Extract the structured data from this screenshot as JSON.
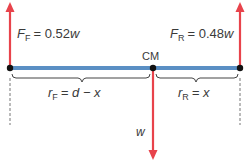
{
  "diagram": {
    "colors": {
      "force": "#e8434b",
      "beam": "#5a8fc4",
      "point": "#111111",
      "brace": "#444444",
      "dashed": "#777777",
      "text": "#3a3a3a"
    },
    "forces": {
      "front": {
        "symbol": "F",
        "subscript": "F",
        "rhs": "= 0.52",
        "var": "w"
      },
      "rear": {
        "symbol": "F",
        "subscript": "R",
        "rhs": "= 0.48",
        "var": "w"
      },
      "weight": {
        "symbol": "w"
      }
    },
    "cm_label": "CM",
    "distances": {
      "front": {
        "symbol": "r",
        "subscript": "F",
        "rhs": "= d − x"
      },
      "rear": {
        "symbol": "r",
        "subscript": "R",
        "rhs": "= x"
      }
    }
  }
}
